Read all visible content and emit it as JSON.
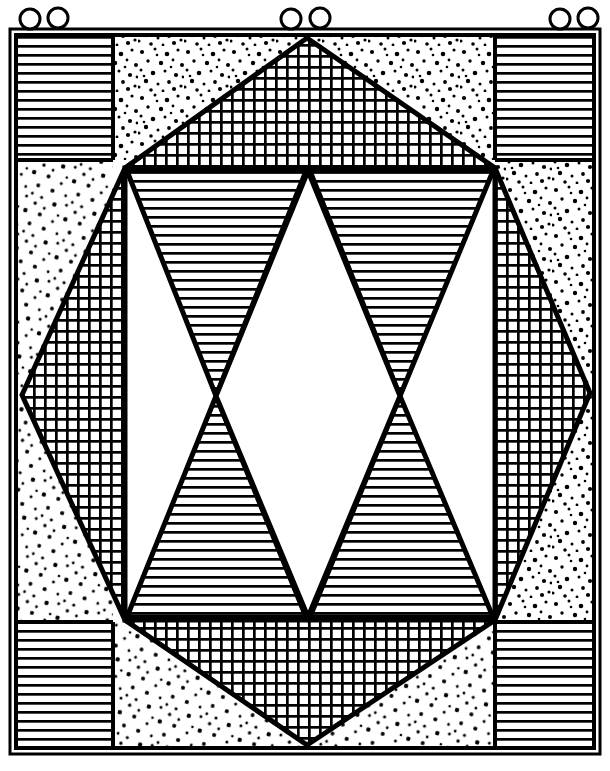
{
  "document": {
    "title": "Quilt Block Line Drawing",
    "kind": "line-art-illustration",
    "width": 610,
    "height": 771,
    "background_color": "#ffffff",
    "ink_color": "#000000"
  },
  "frame": {
    "outer_border": {
      "name": "outer-frame",
      "x": 10,
      "y": 29,
      "width": 590,
      "height": 725,
      "stroke_width": 3,
      "color": "#000000"
    },
    "inner_border": {
      "name": "inner-frame",
      "x": 16,
      "y": 35,
      "width": 578,
      "height": 713,
      "stroke_width": 3,
      "color": "#000000"
    }
  },
  "hanging_rings": {
    "label": "hanging rings",
    "count": 6,
    "radius": 10,
    "stroke_width": 3,
    "color": "#000000",
    "positions": [
      {
        "cx": 30,
        "cy": 19
      },
      {
        "cx": 58,
        "cy": 18
      },
      {
        "cx": 291,
        "cy": 19
      },
      {
        "cx": 320,
        "cy": 18
      },
      {
        "cx": 560,
        "cy": 19
      },
      {
        "cx": 588,
        "cy": 18
      }
    ]
  },
  "grid_lines": {
    "label": "block division lines",
    "vertical_x": [
      113,
      495
    ],
    "horizontal_y": [
      160,
      622
    ],
    "stroke_width": 4,
    "color": "#000000"
  },
  "corner_blocks": {
    "fill": "horizontal-stripes",
    "stripe_spacing": 9,
    "stripe_width": 2.6,
    "color": "#000000",
    "blocks": [
      {
        "name": "corner-block-top-left",
        "x": 16,
        "y": 35,
        "width": 97,
        "height": 125
      },
      {
        "name": "corner-block-top-right",
        "x": 495,
        "y": 35,
        "width": 99,
        "height": 125
      },
      {
        "name": "corner-block-bottom-left",
        "x": 16,
        "y": 622,
        "width": 97,
        "height": 126
      },
      {
        "name": "corner-block-bottom-right",
        "x": 495,
        "y": 622,
        "width": 99,
        "height": 126
      }
    ]
  },
  "edge_panels": {
    "fill": "stipple-dots",
    "dot_color": "#000000",
    "description": "Speckled background panels filling the border band around the central octagon",
    "panels": [
      {
        "name": "edge-panel-top",
        "x": 113,
        "y": 35,
        "width": 382,
        "height": 125
      },
      {
        "name": "edge-panel-bottom",
        "x": 113,
        "y": 622,
        "width": 382,
        "height": 126
      },
      {
        "name": "edge-panel-left",
        "x": 16,
        "y": 160,
        "width": 97,
        "height": 462
      },
      {
        "name": "edge-panel-right",
        "x": 495,
        "y": 160,
        "width": 99,
        "height": 462
      }
    ]
  },
  "octagon": {
    "name": "central-octagon",
    "fill": "crosshatch-grid",
    "grid_spacing": 11,
    "grid_line_width": 2.6,
    "stroke_width": 5,
    "color": "#000000",
    "vertices": [
      {
        "x": 307,
        "y": 38
      },
      {
        "x": 495,
        "y": 168
      },
      {
        "x": 590,
        "y": 393
      },
      {
        "x": 495,
        "y": 620
      },
      {
        "x": 307,
        "y": 745
      },
      {
        "x": 125,
        "y": 620
      },
      {
        "x": 22,
        "y": 395
      },
      {
        "x": 125,
        "y": 168
      }
    ]
  },
  "inner_panel": {
    "name": "inner-rectangle",
    "x": 125,
    "y": 168,
    "width": 370,
    "height": 452,
    "fill": "#ffffff",
    "stroke_width": 5,
    "color": "#000000"
  },
  "inner_triangles": {
    "fill": "horizontal-stripes",
    "stripe_spacing": 9,
    "stripe_width": 2.6,
    "color": "#000000",
    "stroke_width": 5,
    "count": 4,
    "description": "Two hourglass pairs of horizontally hatched triangles flanking a white centre diamond",
    "shapes": [
      {
        "name": "triangle-upper-left",
        "points": "125,173 305,173 215,396"
      },
      {
        "name": "triangle-lower-left",
        "points": "125,616 305,616 215,396"
      },
      {
        "name": "triangle-upper-right",
        "points": "311,173 491,173 401,396"
      },
      {
        "name": "triangle-lower-right",
        "points": "311,616 491,616 401,396"
      }
    ]
  },
  "centre_diamond": {
    "name": "centre-diamond",
    "fill": "#ffffff",
    "points": "308,173 401,396 308,616 215,396",
    "stroke_width": 5,
    "color": "#000000"
  }
}
